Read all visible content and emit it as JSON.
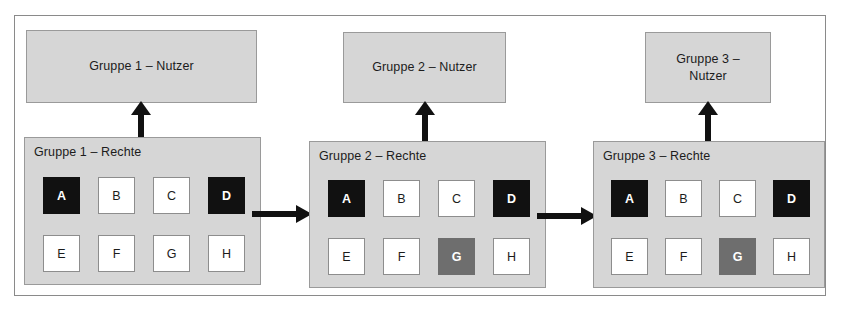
{
  "diagram": {
    "colors": {
      "panel_fill": "#d6d6d6",
      "panel_border": "#9a9a9a",
      "frame_border": "#8a8a8a",
      "cell_white": "#ffffff",
      "cell_black": "#111111",
      "cell_gray": "#6e6e6e",
      "text": "#1c1c1c",
      "arrow": "#111111",
      "background": "#ffffff"
    },
    "groups": [
      {
        "id": "group-1",
        "user_box_label": "Gruppe 1 – Nutzer",
        "rights_box_label": "Gruppe 1 – Rechte",
        "cells": [
          {
            "label": "A",
            "state": "black"
          },
          {
            "label": "B",
            "state": "white"
          },
          {
            "label": "C",
            "state": "white"
          },
          {
            "label": "D",
            "state": "black"
          },
          {
            "label": "E",
            "state": "white"
          },
          {
            "label": "F",
            "state": "white"
          },
          {
            "label": "G",
            "state": "white"
          },
          {
            "label": "H",
            "state": "white"
          }
        ]
      },
      {
        "id": "group-2",
        "user_box_label": "Gruppe 2 – Nutzer",
        "rights_box_label": "Gruppe 2 – Rechte",
        "cells": [
          {
            "label": "A",
            "state": "black"
          },
          {
            "label": "B",
            "state": "white"
          },
          {
            "label": "C",
            "state": "white"
          },
          {
            "label": "D",
            "state": "black"
          },
          {
            "label": "E",
            "state": "white"
          },
          {
            "label": "F",
            "state": "white"
          },
          {
            "label": "G",
            "state": "gray"
          },
          {
            "label": "H",
            "state": "white"
          }
        ]
      },
      {
        "id": "group-3",
        "user_box_label": "Gruppe 3 –\nNutzer",
        "rights_box_label": "Gruppe 3 – Rechte",
        "cells": [
          {
            "label": "A",
            "state": "black"
          },
          {
            "label": "B",
            "state": "white"
          },
          {
            "label": "C",
            "state": "white"
          },
          {
            "label": "D",
            "state": "black"
          },
          {
            "label": "E",
            "state": "white"
          },
          {
            "label": "F",
            "state": "white"
          },
          {
            "label": "G",
            "state": "gray"
          },
          {
            "label": "H",
            "state": "white"
          }
        ]
      }
    ],
    "connectors": [
      {
        "id": "arrow-up-1",
        "direction": "up",
        "from": "group-1-rights",
        "to": "group-1-users"
      },
      {
        "id": "arrow-up-2",
        "direction": "up",
        "from": "group-2-rights",
        "to": "group-2-users"
      },
      {
        "id": "arrow-up-3",
        "direction": "up",
        "from": "group-3-rights",
        "to": "group-3-users"
      },
      {
        "id": "arrow-right-1",
        "direction": "right",
        "from": "group-1-rights",
        "to": "group-2-rights"
      },
      {
        "id": "arrow-right-2",
        "direction": "right",
        "from": "group-2-rights",
        "to": "group-3-rights"
      }
    ]
  }
}
